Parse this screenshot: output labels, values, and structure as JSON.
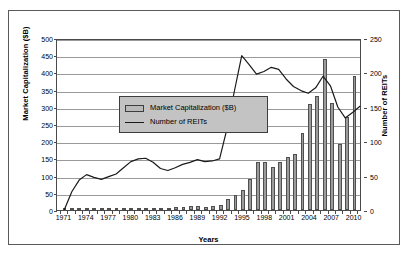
{
  "chart_data": {
    "type": "bar",
    "title": "",
    "xlabel": "Years",
    "ylabel": "Market Capitalization ($B)",
    "y2label": "Number of REITs",
    "ylim": [
      0,
      500
    ],
    "y2lim": [
      0,
      250
    ],
    "ytick_step": 50,
    "y2tick_step": 50,
    "grid": "horizontal",
    "legend_position": "inside top-left",
    "xlim": [
      1971,
      2011
    ],
    "xtick_labels": [
      "1971",
      "1974",
      "1977",
      "1980",
      "1983",
      "1986",
      "1989",
      "1992",
      "1995",
      "1998",
      "2001",
      "2004",
      "2007",
      "2010"
    ],
    "xticks": [
      1971,
      1974,
      1977,
      1980,
      1983,
      1986,
      1989,
      1992,
      1995,
      1998,
      2001,
      2004,
      2007,
      2010
    ],
    "x": [
      1971,
      1972,
      1973,
      1974,
      1975,
      1976,
      1977,
      1978,
      1979,
      1980,
      1981,
      1982,
      1983,
      1984,
      1985,
      1986,
      1987,
      1988,
      1989,
      1990,
      1991,
      1992,
      1993,
      1994,
      1995,
      1996,
      1997,
      1998,
      1999,
      2000,
      2001,
      2002,
      2003,
      2004,
      2005,
      2006,
      2007,
      2008,
      2009,
      2010
    ],
    "series": [
      {
        "name": "Market Capitalization ($B)",
        "kind": "bar",
        "axis": "left",
        "color": "#9b9b9b",
        "edge_color": "#4f4f4f",
        "units": "$B",
        "values": [
          1.5,
          1.9,
          2.3,
          2.0,
          1.6,
          1.5,
          1.4,
          1.4,
          1.8,
          2.3,
          2.4,
          3.3,
          4.3,
          5.1,
          7.1,
          9.9,
          9.7,
          11.4,
          11.7,
          8.7,
          12.9,
          15.9,
          32.2,
          44.3,
          57.5,
          88.8,
          140.5,
          138.3,
          124.3,
          138.7,
          154.9,
          161.9,
          224.2,
          308.0,
          330.7,
          438.1,
          312.0,
          191.7,
          271.2,
          389.3
        ]
      },
      {
        "name": "Number of REITs",
        "kind": "line",
        "axis": "right",
        "color": "#1a1a1a",
        "units": "count",
        "values": [
          2,
          28,
          45,
          53,
          49,
          46,
          50,
          54,
          63,
          72,
          76,
          77,
          71,
          62,
          59,
          63,
          68,
          71,
          75,
          72,
          73,
          76,
          120,
          175,
          227,
          214,
          200,
          204,
          210,
          207,
          193,
          182,
          176,
          172,
          180,
          197,
          183,
          152,
          136,
          144
        ]
      }
    ],
    "series_extra_point": {
      "x": 2011,
      "number_of_reits": 153
    }
  },
  "legend": {
    "items": [
      {
        "label": "Market Capitalization ($B)",
        "marker": "bar-swatch"
      },
      {
        "label": "Number of REITs",
        "marker": "line-swatch"
      }
    ]
  },
  "axes": {
    "left_title": "Market Capitalization ($B)",
    "right_title": "Number of REITs",
    "x_title": "Years",
    "left_ticks": [
      "500",
      "450",
      "400",
      "350",
      "300",
      "250",
      "200",
      "150",
      "100",
      "50",
      "0"
    ],
    "right_ticks": [
      "250",
      "200",
      "150",
      "100",
      "50",
      "0"
    ]
  }
}
